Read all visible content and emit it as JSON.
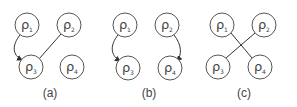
{
  "panels": [
    {
      "label": "(a)",
      "label_pos": [
        50,
        97
      ],
      "nodes": [
        {
          "id": "1",
          "symbol": "ρ",
          "sub": "1",
          "x": 27,
          "y": 25
        },
        {
          "id": "2",
          "symbol": "ρ",
          "sub": "2",
          "x": 69,
          "y": 25
        },
        {
          "id": "3",
          "symbol": "ρ",
          "sub": "3",
          "x": 31,
          "y": 67
        },
        {
          "id": "4",
          "symbol": "ρ",
          "sub": "4",
          "x": 72,
          "y": 67
        }
      ],
      "edges": [
        {
          "from": "1",
          "to": "3",
          "type": "curved-arrow"
        },
        {
          "from": "2",
          "to": "3",
          "type": "line"
        }
      ]
    },
    {
      "label": "(b)",
      "label_pos": [
        149,
        97
      ],
      "nodes": [
        {
          "id": "1",
          "symbol": "ρ",
          "sub": "1",
          "x": 125,
          "y": 25
        },
        {
          "id": "2",
          "symbol": "ρ",
          "sub": "2",
          "x": 167,
          "y": 25
        },
        {
          "id": "3",
          "symbol": "ρ",
          "sub": "3",
          "x": 128,
          "y": 68
        },
        {
          "id": "4",
          "symbol": "ρ",
          "sub": "4",
          "x": 170,
          "y": 68
        }
      ],
      "edges": [
        {
          "from": "1",
          "to": "3",
          "type": "curved-arrow"
        },
        {
          "from": "2",
          "to": "4",
          "type": "curved-arrow"
        }
      ]
    },
    {
      "label": "(c)",
      "label_pos": [
        244,
        97
      ],
      "nodes": [
        {
          "id": "1",
          "symbol": "ρ",
          "sub": "1",
          "x": 222,
          "y": 25
        },
        {
          "id": "2",
          "symbol": "ρ",
          "sub": "2",
          "x": 264,
          "y": 25
        },
        {
          "id": "3",
          "symbol": "ρ",
          "sub": "3",
          "x": 218,
          "y": 67
        },
        {
          "id": "4",
          "symbol": "ρ",
          "sub": "4",
          "x": 260,
          "y": 67
        }
      ],
      "edges": [
        {
          "from": "1",
          "to": "4",
          "type": "line"
        },
        {
          "from": "2",
          "to": "3",
          "type": "line"
        }
      ]
    }
  ]
}
